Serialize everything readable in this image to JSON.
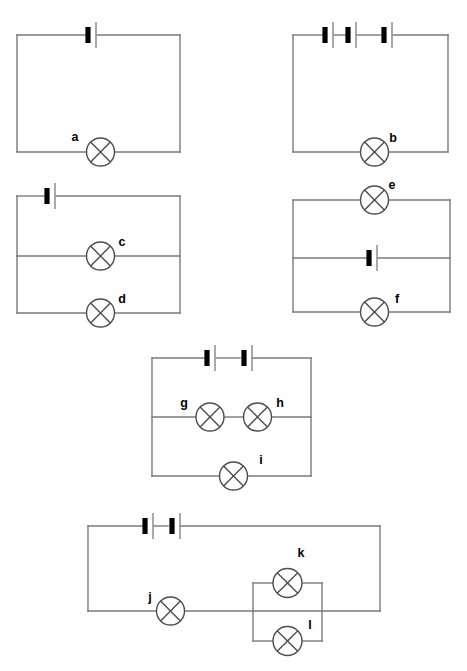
{
  "colors": {
    "wire": "#7a7a7a",
    "lamp_outline": "#4d4d4d",
    "cell_positive": "#8c8c8c",
    "cell_negative": "#000000",
    "label_text": "#000000",
    "background": "#ffffff"
  },
  "symbols": {
    "lamp": "lamp-crossed-circle",
    "cell": "battery-cell"
  },
  "circuits": [
    {
      "id": "circuit-1",
      "name": "simple-series-single-cell",
      "cells": 1,
      "lamps": [
        {
          "label": "a",
          "branch": "bottom",
          "label_x": 75,
          "label_y": 138
        }
      ]
    },
    {
      "id": "circuit-2",
      "name": "three-cells-single-lamp",
      "cells": 3,
      "lamps": [
        {
          "label": "b",
          "branch": "bottom",
          "label_x": 393,
          "label_y": 139
        }
      ]
    },
    {
      "id": "circuit-3",
      "name": "two-parallel-lamps-one-cell",
      "cells": 1,
      "lamps": [
        {
          "label": "c",
          "branch": "middle",
          "label_x": 122,
          "label_y": 243
        },
        {
          "label": "d",
          "branch": "bottom",
          "label_x": 122,
          "label_y": 300
        }
      ]
    },
    {
      "id": "circuit-4",
      "name": "cell-in-middle-branch-two-lamps",
      "cells": 1,
      "lamps": [
        {
          "label": "e",
          "branch": "top",
          "label_x": 392,
          "label_y": 186
        },
        {
          "label": "f",
          "branch": "bottom",
          "label_x": 397,
          "label_y": 300
        }
      ]
    },
    {
      "id": "circuit-5",
      "name": "two-cells-series-pair-and-parallel-lamp",
      "cells": 2,
      "lamps": [
        {
          "label": "g",
          "branch": "middle-left",
          "label_x": 184,
          "label_y": 404
        },
        {
          "label": "h",
          "branch": "middle-right",
          "label_x": 280,
          "label_y": 404
        },
        {
          "label": "i",
          "branch": "bottom",
          "label_x": 261,
          "label_y": 461
        }
      ]
    },
    {
      "id": "circuit-6",
      "name": "series-lamp-with-parallel-pair",
      "cells": 2,
      "lamps": [
        {
          "label": "j",
          "branch": "series",
          "label_x": 150,
          "label_y": 598
        },
        {
          "label": "k",
          "branch": "parallel-top",
          "label_x": 301,
          "label_y": 554
        },
        {
          "label": "l",
          "branch": "parallel-bottom",
          "label_x": 310,
          "label_y": 626
        }
      ]
    }
  ],
  "labels": {
    "a": "a",
    "b": "b",
    "c": "c",
    "d": "d",
    "e": "e",
    "f": "f",
    "g": "g",
    "h": "h",
    "i": "i",
    "j": "j",
    "k": "k",
    "l": "l"
  }
}
